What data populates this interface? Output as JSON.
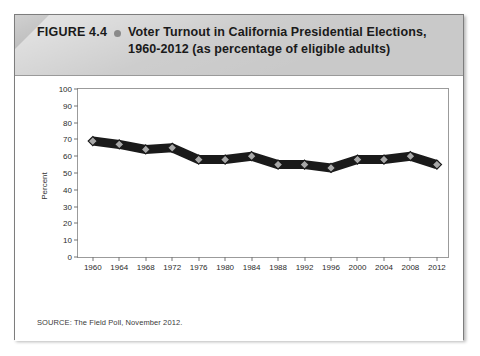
{
  "figure": {
    "number_label": "FIGURE 4.4",
    "bullet_icon": "bullet-dot-icon",
    "title_line1": "Voter Turnout in California Presidential Elections,",
    "title_line2": "1960-2012 (as percentage of eligible adults)",
    "source": "SOURCE: The Field Poll, November 2012."
  },
  "colors": {
    "header_band": "#c9c9c9",
    "header_fold": "#8e8e8e",
    "card_border": "#7d7d7d",
    "plot_border": "#9b9b9b",
    "line": "#1a1a1a",
    "marker_fill": "#a8a8a8",
    "marker_stroke": "#1a1a1a",
    "text": "#1a1a1a"
  },
  "chart_data": {
    "type": "line",
    "title": "Voter Turnout in California Presidential Elections, 1960-2012 (as percentage of eligible adults)",
    "xlabel": "",
    "ylabel": "Percent",
    "categories": [
      "1960",
      "1964",
      "1968",
      "1972",
      "1976",
      "1980",
      "1984",
      "1988",
      "1992",
      "1996",
      "2000",
      "2004",
      "2008",
      "2012"
    ],
    "values": [
      69,
      67,
      64,
      65,
      58,
      58,
      60,
      55,
      55,
      53,
      58,
      58,
      60,
      55
    ],
    "ylim": [
      0,
      100
    ],
    "ytick_step": 10,
    "yticks": [
      100,
      90,
      80,
      70,
      60,
      50,
      40,
      30,
      20,
      10,
      0
    ],
    "grid": false,
    "legend": false,
    "marker": "diamond",
    "series": [
      {
        "name": "Voter turnout",
        "values": [
          69,
          67,
          64,
          65,
          58,
          58,
          60,
          55,
          55,
          53,
          58,
          58,
          60,
          55
        ]
      }
    ]
  }
}
